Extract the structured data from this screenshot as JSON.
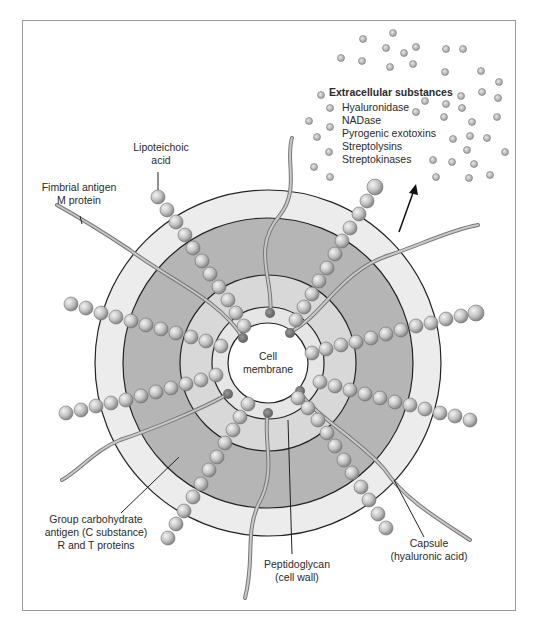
{
  "diagram": {
    "type": "cross-section",
    "colors": {
      "background": "#ffffff",
      "frame": "#9a9a9a",
      "outer_capsule": "#ececec",
      "dark_band": "#b3b3b3",
      "inner_light_ring": "#d6d6d6",
      "inner_thin_ring": "#e6e6e6",
      "membrane": "#ffffff",
      "outline": "#222222",
      "bead": "#c8c8c8",
      "fiber": "#8a8a8a"
    },
    "center": {
      "label_line1": "Cell",
      "label_line2": "membrane"
    },
    "labels": {
      "lipoteichoic": {
        "line1": "Lipoteichoic",
        "line2": "acid"
      },
      "fimbrial": {
        "line1": "Fimbrial antigen",
        "line2": "M protein"
      },
      "group_carb": {
        "line1": "Group carbohydrate",
        "line2": "antigen (C substance)",
        "line3": "R and T proteins"
      },
      "peptidoglycan": {
        "line1": "Peptidoglycan",
        "line2": "(cell wall)"
      },
      "capsule": {
        "line1": "Capsule",
        "line2": "(hyaluronic acid)"
      }
    },
    "extracellular": {
      "title": "Extracellular substances",
      "items": [
        "Hyaluronidase",
        "NADase",
        "Pyrogenic exotoxins",
        "Streptolysins",
        "Streptokinases"
      ]
    }
  }
}
